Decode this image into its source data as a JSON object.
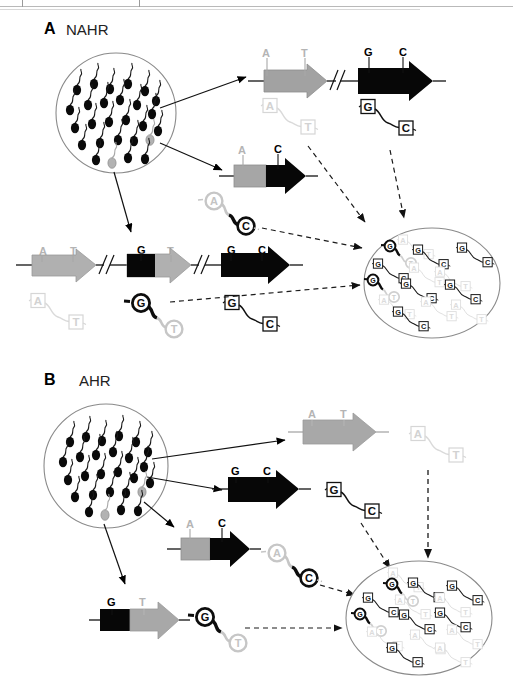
{
  "figure": {
    "panels": [
      {
        "id": "A",
        "label": "A",
        "title": "NAHR",
        "source_pool": "sperm-pool-nahr",
        "product_pool": "product-pool-nahr"
      },
      {
        "id": "B",
        "label": "B",
        "title": "AHR",
        "source_pool": "sperm-pool-ahr",
        "product_pool": "product-pool-ahr"
      }
    ]
  },
  "alleles": {
    "a": "A",
    "t": "T",
    "g": "G",
    "c": "C"
  },
  "panelA": {
    "gene_row_top": {
      "left_arrow_markers": [
        "A",
        "T"
      ],
      "right_arrow_markers": [
        "G",
        "C"
      ],
      "break_symbol": "//"
    },
    "recombinant_arrow": {
      "markers": [
        "A",
        "C"
      ]
    },
    "gene_row_bottom": {
      "arrow1_markers": [
        "A",
        "T"
      ],
      "arrow2_markers": [
        "G",
        "T"
      ],
      "arrow3_markers": [
        "G",
        "C"
      ],
      "break_symbol": "//"
    },
    "molecules": {
      "at_faded": [
        "A",
        "T"
      ],
      "gc_boxed": [
        "G",
        "C"
      ],
      "ac_circled": [
        "A",
        "C"
      ],
      "gt_circled": [
        "G",
        "T"
      ],
      "gc_boxed_2": [
        "G",
        "C"
      ]
    }
  },
  "panelB": {
    "gene_arrow_gray": {
      "markers": [
        "A",
        "T"
      ]
    },
    "gene_arrow_black": {
      "markers": [
        "G",
        "C"
      ]
    },
    "recombinant_arrow_ac": {
      "markers": [
        "A",
        "C"
      ]
    },
    "recombinant_arrow_gt": {
      "markers": [
        "G",
        "T"
      ]
    },
    "molecules": {
      "at_faded": [
        "A",
        "T"
      ],
      "gc_boxed": [
        "G",
        "C"
      ],
      "ac_circled": [
        "A",
        "C"
      ],
      "gt_circled": [
        "G",
        "T"
      ]
    }
  },
  "colors": {
    "black": "#000000",
    "gray_arrow": "#9d9d9d",
    "gray_light": "#c9c9c9",
    "gray_pale": "#e2e2e2",
    "outline": "#6e6e6e"
  }
}
